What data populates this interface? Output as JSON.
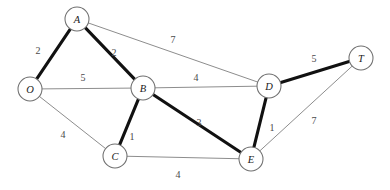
{
  "figure": {
    "width": 390,
    "height": 190,
    "background_color": "#ffffff",
    "node_fill_color": "#ffffff",
    "node_stroke_color": "#6f6f6f",
    "thin_edge_color": "#8d8d8d",
    "bold_edge_color": "#111111"
  },
  "chart_data": {
    "type": "diagram",
    "title": "",
    "nodes": [
      {
        "id": "O",
        "label": "O",
        "x": 30,
        "y": 89,
        "r": 12
      },
      {
        "id": "A",
        "label": "A",
        "x": 77,
        "y": 19,
        "r": 12
      },
      {
        "id": "B",
        "label": "B",
        "x": 143,
        "y": 88,
        "r": 12
      },
      {
        "id": "C",
        "label": "C",
        "x": 115,
        "y": 156,
        "r": 12
      },
      {
        "id": "D",
        "label": "D",
        "x": 269,
        "y": 86,
        "r": 12
      },
      {
        "id": "E",
        "label": "E",
        "x": 251,
        "y": 159,
        "r": 12
      },
      {
        "id": "T",
        "label": "T",
        "x": 361,
        "y": 58,
        "r": 12
      }
    ],
    "edges": [
      {
        "from": "O",
        "to": "A",
        "weight": "2",
        "highlighted": true,
        "label_x": 38,
        "label_y": 50
      },
      {
        "from": "A",
        "to": "B",
        "weight": "2",
        "highlighted": true,
        "label_x": 114,
        "label_y": 52
      },
      {
        "from": "A",
        "to": "D",
        "weight": "7",
        "highlighted": false,
        "label_x": 173,
        "label_y": 39
      },
      {
        "from": "O",
        "to": "B",
        "weight": "5",
        "highlighted": false,
        "label_x": 83,
        "label_y": 77
      },
      {
        "from": "B",
        "to": "D",
        "weight": "4",
        "highlighted": false,
        "label_x": 196,
        "label_y": 77
      },
      {
        "from": "O",
        "to": "C",
        "weight": "4",
        "highlighted": false,
        "label_x": 63,
        "label_y": 134
      },
      {
        "from": "B",
        "to": "C",
        "weight": "1",
        "highlighted": true,
        "label_x": 132,
        "label_y": 136
      },
      {
        "from": "B",
        "to": "E",
        "weight": "3",
        "highlighted": true,
        "label_x": 199,
        "label_y": 122
      },
      {
        "from": "C",
        "to": "E",
        "weight": "4",
        "highlighted": false,
        "label_x": 178,
        "label_y": 174
      },
      {
        "from": "D",
        "to": "E",
        "weight": "1",
        "highlighted": true,
        "label_x": 272,
        "label_y": 127
      },
      {
        "from": "D",
        "to": "T",
        "weight": "5",
        "highlighted": true,
        "label_x": 314,
        "label_y": 58
      },
      {
        "from": "E",
        "to": "T",
        "weight": "7",
        "highlighted": false,
        "label_x": 314,
        "label_y": 120
      }
    ]
  }
}
